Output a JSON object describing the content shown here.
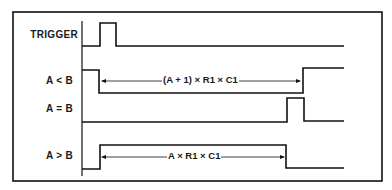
{
  "diagram": {
    "type": "timing-diagram",
    "signals": [
      {
        "name": "TRIGGER",
        "description": "short positive pulse"
      },
      {
        "name": "A < B",
        "description": "goes low on trigger, returns high after (A + 1) x R1 x C1"
      },
      {
        "name": "A = B",
        "description": "short pulse at end of A < B interval"
      },
      {
        "name": "A > B",
        "description": "goes high on trigger, returns low after A x R1 x C1"
      }
    ],
    "annotations": {
      "a_less_b_interval": "(A + 1) × R1 × C1",
      "a_greater_b_interval": "A × R1 × C1"
    }
  },
  "colors": {
    "line": "#111111",
    "background": "#ffffff"
  }
}
